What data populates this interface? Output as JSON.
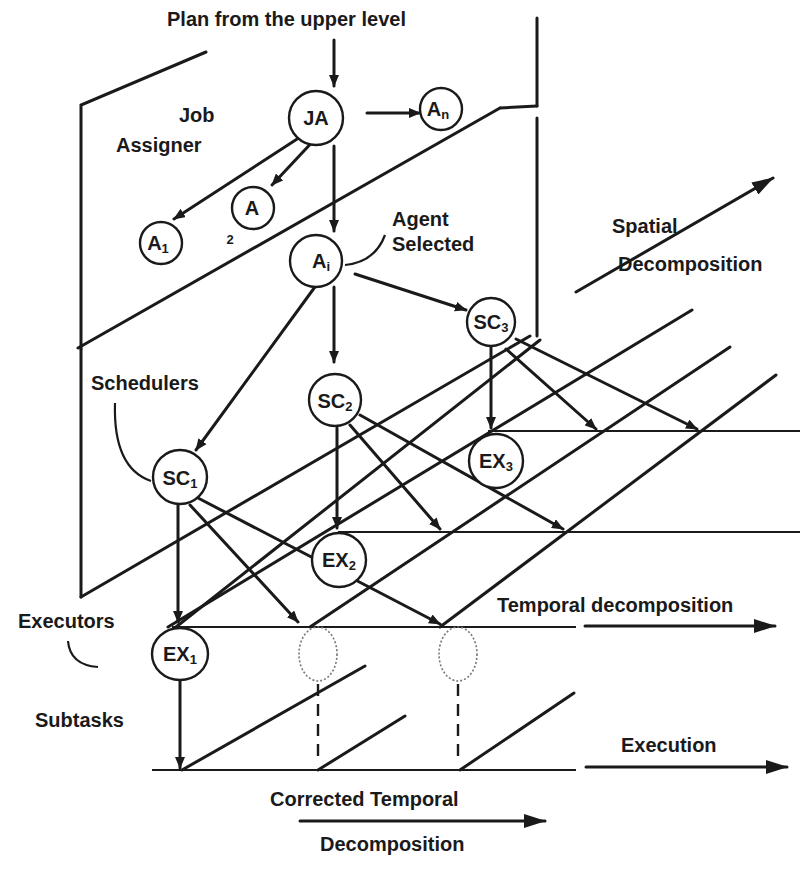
{
  "diagram": {
    "title": "Plan from the upper level",
    "labels": {
      "job_assigner_line1": "Job",
      "job_assigner_line2": "Assigner",
      "agent_selected_line1": "Agent",
      "agent_selected_line2": "Selected",
      "spatial_line1": "Spatial",
      "spatial_line2": "Decomposition",
      "schedulers": "Schedulers",
      "executors": "Executors",
      "subtasks": "Subtasks",
      "temporal_decomposition": "Temporal decomposition",
      "execution": "Execution",
      "corrected_line1": "Corrected Temporal",
      "corrected_line2": "Decomposition"
    },
    "nodes": {
      "ja": {
        "main": "JA",
        "sub": ""
      },
      "an": {
        "main": "A",
        "sub": "n"
      },
      "a1": {
        "main": "A",
        "sub": "1"
      },
      "a2": {
        "main": "A",
        "sub": "2"
      },
      "ai": {
        "main": "A",
        "sub": "i"
      },
      "sc1": {
        "main": "SC",
        "sub": "1"
      },
      "sc2": {
        "main": "SC",
        "sub": "2"
      },
      "sc3": {
        "main": "SC",
        "sub": "3"
      },
      "ex1": {
        "main": "EX",
        "sub": "1"
      },
      "ex2": {
        "main": "EX",
        "sub": "2"
      },
      "ex3": {
        "main": "EX",
        "sub": "3"
      }
    },
    "edges": [
      [
        "plan",
        "ja"
      ],
      [
        "ja",
        "an"
      ],
      [
        "ja",
        "a1"
      ],
      [
        "ja",
        "a2"
      ],
      [
        "ja",
        "ai"
      ],
      [
        "ai",
        "sc1"
      ],
      [
        "ai",
        "sc2"
      ],
      [
        "ai",
        "sc3"
      ],
      [
        "sc1",
        "ex1"
      ],
      [
        "sc2",
        "ex2"
      ],
      [
        "sc3",
        "ex3"
      ],
      [
        "ex1",
        "subtasks"
      ]
    ],
    "colors": {
      "ink": "#1a1a1a",
      "background": "#ffffff"
    }
  }
}
